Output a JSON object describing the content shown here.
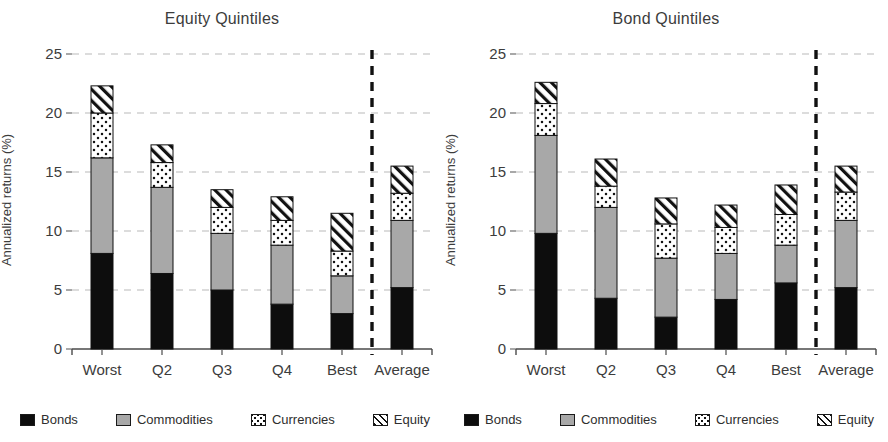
{
  "figure": {
    "background": "#ffffff",
    "panels": [
      "equity",
      "bond"
    ]
  },
  "axis": {
    "ylabel": "Annualized returns (%)",
    "yticks": [
      "0",
      "5",
      "10",
      "15",
      "20",
      "25"
    ],
    "ymin": 0,
    "ymax": 25,
    "gridline_color": "#b9b9b9",
    "axis_color": "#6e6e6e",
    "separator_color": "#111111"
  },
  "legend": {
    "items": [
      {
        "label": "Bonds",
        "key": "bonds",
        "fill": "#0d0d0d",
        "pattern": "solid-black"
      },
      {
        "label": "Commodities",
        "key": "commodities",
        "fill": "#a8a8a8",
        "pattern": "solid-gray"
      },
      {
        "label": "Currencies",
        "key": "currencies",
        "fill": "#ffffff",
        "pattern": "dots"
      },
      {
        "label": "Equity",
        "key": "equity",
        "fill": "#ffffff",
        "pattern": "diagonal-hatch"
      }
    ]
  },
  "chart_data": [
    {
      "id": "equity",
      "type": "bar",
      "stacked": true,
      "title": "Equity Quintiles",
      "xlabel": "",
      "ylabel": "Annualized returns (%)",
      "ylim": [
        0,
        25
      ],
      "yticks": [
        0,
        5,
        10,
        15,
        20,
        25
      ],
      "grid": true,
      "legend_position": "bottom",
      "categories": [
        "Worst",
        "Q2",
        "Q3",
        "Q4",
        "Best",
        "Average"
      ],
      "separator_after_category": "Best",
      "series": [
        {
          "name": "Bonds",
          "values": [
            8.1,
            6.4,
            5.0,
            3.8,
            3.0,
            5.2
          ]
        },
        {
          "name": "Commodities",
          "values": [
            8.1,
            7.3,
            4.8,
            5.0,
            3.2,
            5.7
          ]
        },
        {
          "name": "Currencies",
          "values": [
            3.8,
            2.1,
            2.2,
            2.1,
            2.1,
            2.3
          ]
        },
        {
          "name": "Equity",
          "values": [
            2.3,
            1.5,
            1.5,
            2.0,
            3.2,
            2.3
          ]
        }
      ],
      "totals": [
        22.3,
        17.3,
        13.5,
        12.9,
        11.5,
        15.5
      ]
    },
    {
      "id": "bond",
      "type": "bar",
      "stacked": true,
      "title": "Bond Quintiles",
      "xlabel": "",
      "ylabel": "Annualized returns (%)",
      "ylim": [
        0,
        25
      ],
      "yticks": [
        0,
        5,
        10,
        15,
        20,
        25
      ],
      "grid": true,
      "legend_position": "bottom",
      "categories": [
        "Worst",
        "Q2",
        "Q3",
        "Q4",
        "Best",
        "Average"
      ],
      "separator_after_category": "Best",
      "series": [
        {
          "name": "Bonds",
          "values": [
            9.8,
            4.3,
            2.7,
            4.2,
            5.6,
            5.2
          ]
        },
        {
          "name": "Commodities",
          "values": [
            8.3,
            7.7,
            5.0,
            3.9,
            3.2,
            5.7
          ]
        },
        {
          "name": "Currencies",
          "values": [
            2.7,
            1.8,
            2.9,
            2.2,
            2.6,
            2.4
          ]
        },
        {
          "name": "Equity",
          "values": [
            1.8,
            2.3,
            2.2,
            1.9,
            2.5,
            2.2
          ]
        }
      ],
      "totals": [
        22.6,
        16.1,
        12.8,
        12.2,
        13.9,
        15.5
      ]
    }
  ]
}
